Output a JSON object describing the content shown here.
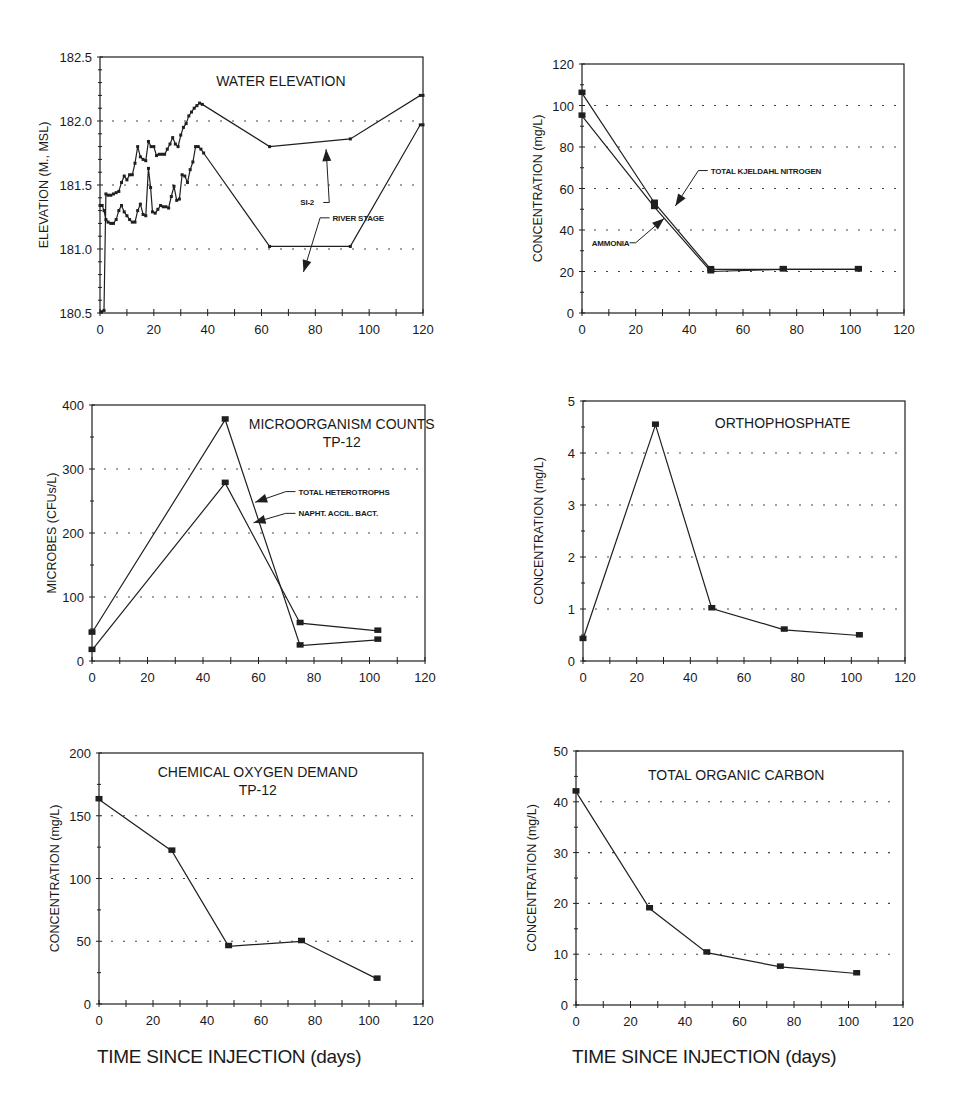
{
  "figure": {
    "bottom_xlabel_left": "TIME SINCE INJECTION (days)",
    "bottom_xlabel_right": "TIME SINCE INJECTION (days)"
  },
  "chart_data": [
    {
      "id": "water",
      "type": "line",
      "title": "WATER ELEVATION",
      "subtitle": "",
      "xlabel": "",
      "ylabel": "ELEVATION (M., MSL)",
      "xlim": [
        0,
        120
      ],
      "ylim": [
        180.5,
        182.5
      ],
      "xticks": [
        0,
        20,
        40,
        60,
        80,
        100,
        120
      ],
      "yticks": [
        180.5,
        181.0,
        181.5,
        182.0,
        182.5
      ],
      "ytick_labels": [
        "180.5",
        "181.0",
        "181.5",
        "182.0",
        "182.5"
      ],
      "grid_y": [
        181.0,
        181.5,
        182.0
      ],
      "frame": {
        "x": 100,
        "y": 57,
        "w": 323,
        "h": 256
      },
      "title_pos": [
        0.56,
        0.09
      ],
      "annotations": [
        {
          "text": "SI-2",
          "tx": 0.62,
          "ty": 0.58,
          "ax": 0.68,
          "ay": 0.54,
          "hx": 0.7,
          "hy": 0.36
        },
        {
          "text": "RIVER STAGE",
          "tx": 0.72,
          "ty": 0.64,
          "ax": 0.7,
          "ay": 0.66,
          "hx": 0.63,
          "hy": 0.84
        }
      ],
      "series": [
        {
          "name": "SI-2",
          "small_markers": true,
          "x": [
            0.5,
            1.5,
            2.2,
            3,
            4,
            5,
            6,
            7,
            8,
            9,
            10,
            11,
            12,
            13,
            14,
            15,
            16,
            17,
            18,
            19,
            20,
            21,
            22,
            23,
            24,
            25,
            26,
            27,
            28,
            29,
            30,
            31,
            32,
            33,
            34,
            35,
            36,
            37,
            38,
            63,
            93,
            119,
            120
          ],
          "y": [
            180.51,
            180.52,
            181.43,
            181.42,
            181.42,
            181.43,
            181.44,
            181.45,
            181.52,
            181.57,
            181.54,
            181.58,
            181.58,
            181.67,
            181.8,
            181.72,
            181.7,
            181.69,
            181.84,
            181.8,
            181.8,
            181.73,
            181.74,
            181.74,
            181.74,
            181.78,
            181.82,
            181.87,
            181.82,
            181.8,
            181.89,
            181.95,
            181.98,
            182.04,
            182.07,
            182.1,
            182.12,
            182.14,
            182.13,
            181.8,
            181.86,
            182.2,
            182.2
          ]
        },
        {
          "name": "RIVER STAGE",
          "small_markers": true,
          "x": [
            0,
            0.8,
            1.5,
            2.2,
            3,
            4,
            5,
            6,
            7,
            8,
            9,
            10,
            11,
            12,
            13,
            14,
            15,
            16,
            17,
            18,
            18.8,
            19.5,
            20.5,
            21.5,
            22.5,
            23.5,
            24.5,
            25.5,
            26.5,
            27.5,
            28.5,
            29.5,
            30.5,
            31.5,
            32.5,
            33.5,
            34.5,
            35.5,
            36.5,
            37.5,
            38.5,
            63,
            93,
            119,
            120
          ],
          "y": [
            181.34,
            181.34,
            181.3,
            181.23,
            181.21,
            181.2,
            181.2,
            181.23,
            181.3,
            181.34,
            181.29,
            181.26,
            181.23,
            181.21,
            181.21,
            181.3,
            181.35,
            181.27,
            181.26,
            181.63,
            181.48,
            181.29,
            181.28,
            181.31,
            181.34,
            181.33,
            181.33,
            181.32,
            181.41,
            181.49,
            181.38,
            181.39,
            181.58,
            181.57,
            181.52,
            181.62,
            181.68,
            181.8,
            181.8,
            181.78,
            181.75,
            181.02,
            181.02,
            181.97,
            181.97
          ]
        }
      ]
    },
    {
      "id": "nitrogen",
      "type": "line",
      "title": "",
      "subtitle": "",
      "xlabel": "",
      "ylabel": "CONCENTRATION (mg/L)",
      "xlim": [
        0,
        120
      ],
      "ylim": [
        0,
        120
      ],
      "xticks": [
        0,
        20,
        40,
        60,
        80,
        100,
        120
      ],
      "yticks": [
        0,
        20,
        40,
        60,
        80,
        100,
        120
      ],
      "ytick_labels": [
        "0",
        "20",
        "40",
        "60",
        "80",
        "100",
        "120"
      ],
      "grid_y": [
        20,
        40,
        60,
        80,
        100
      ],
      "frame": {
        "x": 582,
        "y": 64,
        "w": 322,
        "h": 249
      },
      "title_pos": [
        0.5,
        0.1
      ],
      "annotations": [
        {
          "text": "TOTAL KJELDAHL NITROGEN",
          "tx": 0.4,
          "ty": 0.44,
          "ax": 0.38,
          "ay": 0.45,
          "hx": 0.29,
          "hy": 0.57
        },
        {
          "text": "AMMONIA",
          "tx": 0.03,
          "ty": 0.73,
          "ax": 0.17,
          "ay": 0.73,
          "hx": 0.255,
          "hy": 0.62
        }
      ],
      "series": [
        {
          "name": "TOTAL KJELDAHL NITROGEN",
          "x": [
            0,
            27,
            48,
            75,
            103
          ],
          "y": [
            106,
            53,
            21,
            21,
            21
          ]
        },
        {
          "name": "AMMONIA",
          "x": [
            0,
            27,
            48,
            75,
            103
          ],
          "y": [
            95,
            51,
            20,
            21,
            21
          ]
        }
      ]
    },
    {
      "id": "microbes",
      "type": "line",
      "title": "MICROORGANISM COUNTS",
      "subtitle": "TP-12",
      "xlabel": "",
      "ylabel": "MICROBES (CFUs/L)",
      "xlim": [
        0,
        120
      ],
      "ylim": [
        0,
        400
      ],
      "xticks": [
        0,
        20,
        40,
        60,
        80,
        100,
        120
      ],
      "yticks": [
        0,
        100,
        200,
        300,
        400
      ],
      "ytick_labels": [
        "0",
        "100",
        "200",
        "300",
        "400"
      ],
      "grid_y": [
        100,
        200,
        300
      ],
      "frame": {
        "x": 92,
        "y": 405,
        "w": 333,
        "h": 256
      },
      "title_pos": [
        0.75,
        0.07
      ],
      "annotations": [
        {
          "text": "TOTAL HETEROTROPHS",
          "tx": 0.62,
          "ty": 0.35,
          "ax": 0.6,
          "ay": 0.355,
          "hx": 0.49,
          "hy": 0.38
        },
        {
          "text": "NAPHT. ACCIL. BACT.",
          "tx": 0.62,
          "ty": 0.435,
          "ax": 0.6,
          "ay": 0.435,
          "hx": 0.485,
          "hy": 0.46
        }
      ],
      "series": [
        {
          "name": "TOTAL HETEROTROPHS",
          "x": [
            0,
            48,
            75,
            103
          ],
          "y": [
            44,
            377,
            24,
            33
          ]
        },
        {
          "name": "NAPHT. ACCIL. BACT.",
          "x": [
            0,
            48,
            75,
            103
          ],
          "y": [
            17,
            278,
            59,
            47
          ]
        }
      ]
    },
    {
      "id": "orthophosphate",
      "type": "line",
      "title": "ORTHOPHOSPHATE",
      "subtitle": "",
      "xlabel": "",
      "ylabel": "CONCENTRATION (mg/L)",
      "xlim": [
        0,
        120
      ],
      "ylim": [
        0,
        5
      ],
      "xticks": [
        0,
        20,
        40,
        60,
        80,
        100,
        120
      ],
      "yticks": [
        0,
        1,
        2,
        3,
        4,
        5
      ],
      "ytick_labels": [
        "0",
        "1",
        "2",
        "3",
        "4",
        "5"
      ],
      "grid_y": [
        1,
        2,
        3,
        4
      ],
      "frame": {
        "x": 583,
        "y": 401,
        "w": 322,
        "h": 260
      },
      "title_pos": [
        0.62,
        0.08
      ],
      "annotations": [],
      "series": [
        {
          "name": "ORTHOPHOSPHATE",
          "x": [
            0,
            27,
            48,
            75,
            103
          ],
          "y": [
            0.42,
            4.54,
            1.01,
            0.6,
            0.49
          ]
        }
      ]
    },
    {
      "id": "cod",
      "type": "line",
      "title": "CHEMICAL OXYGEN DEMAND",
      "subtitle": "TP-12",
      "xlabel": "TIME SINCE INJECTION (days)",
      "ylabel": "CONCENTRATION (mg/L)",
      "xlim": [
        0,
        120
      ],
      "ylim": [
        0,
        200
      ],
      "xticks": [
        0,
        20,
        40,
        60,
        80,
        100,
        120
      ],
      "yticks": [
        0,
        50,
        100,
        150,
        200
      ],
      "ytick_labels": [
        "0",
        "50",
        "100",
        "150",
        "200"
      ],
      "grid_y": [
        50,
        100,
        150
      ],
      "frame": {
        "x": 99,
        "y": 753,
        "w": 324,
        "h": 251
      },
      "title_pos": [
        0.49,
        0.07
      ],
      "annotations": [],
      "series": [
        {
          "name": "COD",
          "x": [
            0,
            27,
            48,
            75,
            103
          ],
          "y": [
            163,
            122,
            46,
            50,
            20
          ]
        }
      ]
    },
    {
      "id": "toc",
      "type": "line",
      "title": "TOTAL ORGANIC CARBON",
      "subtitle": "",
      "xlabel": "TIME SINCE INJECTION (days)",
      "ylabel": "CONCENTRATION (mg/L)",
      "xlim": [
        0,
        120
      ],
      "ylim": [
        0,
        50
      ],
      "xticks": [
        0,
        20,
        40,
        60,
        80,
        100,
        120
      ],
      "yticks": [
        0,
        10,
        20,
        30,
        40,
        50
      ],
      "ytick_labels": [
        "0",
        "10",
        "20",
        "30",
        "40",
        "50"
      ],
      "grid_y": [
        10,
        20,
        30,
        40
      ],
      "frame": {
        "x": 576,
        "y": 751,
        "w": 327,
        "h": 254
      },
      "title_pos": [
        0.49,
        0.09
      ],
      "annotations": [],
      "series": [
        {
          "name": "TOC",
          "x": [
            0,
            27,
            48,
            75,
            103
          ],
          "y": [
            42,
            19,
            10.3,
            7.5,
            6.2
          ]
        }
      ]
    }
  ]
}
